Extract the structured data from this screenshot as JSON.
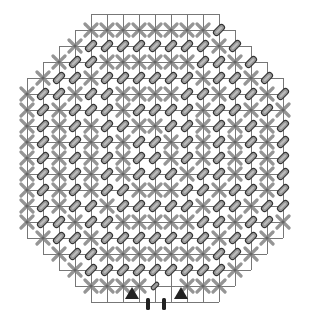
{
  "diagram": {
    "title": "",
    "legend": {
      "X": "cross-marker",
      "P": "pill-marker",
      "p": "small-pill-marker",
      ".": "empty"
    },
    "colors": {
      "grid": "#777777",
      "cross": "#8a8a8a",
      "pill_fill": "#9a9a9a",
      "pill_outline": "#333333",
      "triangle": "#222222",
      "bar": "#222222"
    },
    "grid_size": 18,
    "rows": [
      {
        "row": 1,
        "start_col": 5,
        "cells": "XXXXXXXXP"
      },
      {
        "row": 2,
        "start_col": 4,
        "cells": "XPPPPPPPPXP"
      },
      {
        "row": 3,
        "start_col": 3,
        "cells": "XPPXXXXXXPPXP"
      },
      {
        "row": 4,
        "start_col": 2,
        "cells": "XPPXPPPPPPXPPXP"
      },
      {
        "row": 5,
        "start_col": 1,
        "cells": "XPPXPPXXXXPPXPPXP"
      },
      {
        "row": 6,
        "start_col": 1,
        "cells": "XPXPPPXPPPPXPPXPX"
      },
      {
        "row": 7,
        "start_col": 1,
        "cells": "XPXPXPPXXPPXPXPXP"
      },
      {
        "row": 8,
        "start_col": 1,
        "cells": "XPXPXPXPPXPXPXPXP"
      },
      {
        "row": 9,
        "start_col": 1,
        "cells": "XPXPXPXPPXPXPXPXP"
      },
      {
        "row": 10,
        "start_col": 1,
        "cells": "XPXPXPXPPPXPPXPXP"
      },
      {
        "row": 11,
        "start_col": 1,
        "cells": "XPXPXPPXXXPPXPPXP"
      },
      {
        "row": 12,
        "start_col": 1,
        "cells": "XPXPPXPPPPPXPPXPP"
      },
      {
        "row": 13,
        "start_col": 1,
        "cells": "XPPXPPXXXXXPPXPPX"
      },
      {
        "row": 14,
        "start_col": 2,
        "cells": "XPPXPPPPPPPXPPX"
      },
      {
        "row": 15,
        "start_col": 3,
        "cells": "XPPXXXXXXXPPX"
      },
      {
        "row": 16,
        "start_col": 4,
        "cells": "XPPPPPPPPPX"
      },
      {
        "row": 17,
        "start_col": 5,
        "cells": "XXXXp.XXX"
      }
    ],
    "bottom_markers": [
      {
        "type": "triangle",
        "name": "left-triangle"
      },
      {
        "type": "bar",
        "name": "left-bar"
      },
      {
        "type": "bar",
        "name": "right-bar"
      },
      {
        "type": "triangle",
        "name": "right-triangle"
      }
    ]
  }
}
